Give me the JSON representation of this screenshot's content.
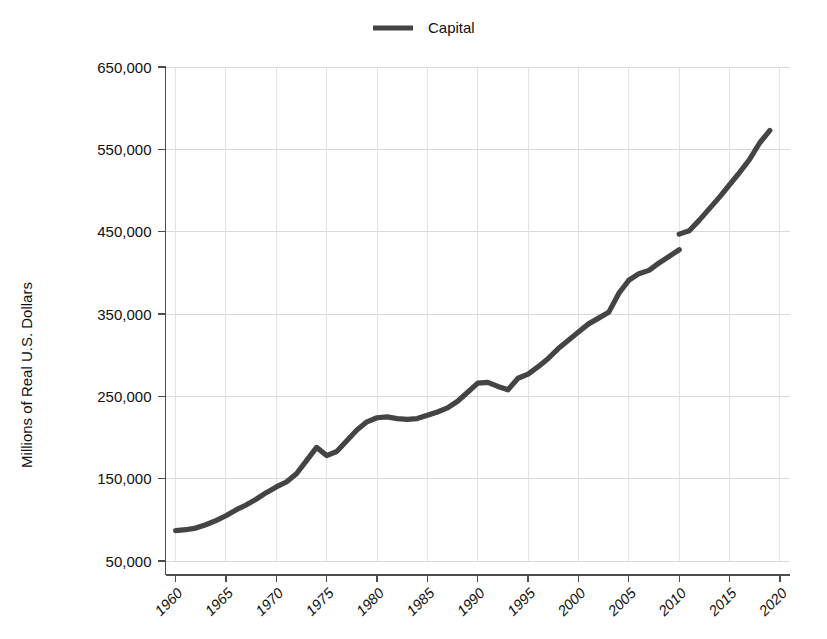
{
  "chart_data": {
    "type": "line",
    "title": "",
    "xlabel": "",
    "ylabel": "Millions of Real U.S. Dollars",
    "legend": {
      "position": "top-center",
      "entries": [
        "Capital"
      ]
    },
    "series_color": "#444444",
    "grid": true,
    "xlim": [
      1959,
      2021
    ],
    "ylim": [
      50000,
      650000
    ],
    "y_ticks": [
      50000,
      150000,
      250000,
      350000,
      450000,
      550000,
      650000
    ],
    "y_tick_labels": [
      "50,000",
      "150,000",
      "250,000",
      "350,000",
      "450,000",
      "550,000",
      "650,000"
    ],
    "x_ticks": [
      1960,
      1965,
      1970,
      1975,
      1980,
      1985,
      1990,
      1995,
      2000,
      2005,
      2010,
      2015,
      2020
    ],
    "x_tick_labels": [
      "1960",
      "1965",
      "1970",
      "1975",
      "1980",
      "1985",
      "1990",
      "1995",
      "2000",
      "2005",
      "2010",
      "2015",
      "2020"
    ],
    "series": [
      {
        "name": "Capital",
        "color": "#444444",
        "x": [
          1960,
          1961,
          1962,
          1963,
          1964,
          1965,
          1966,
          1967,
          1968,
          1969,
          1970,
          1971,
          1972,
          1973,
          1974,
          1975,
          1976,
          1977,
          1978,
          1979,
          1980,
          1981,
          1982,
          1983,
          1984,
          1985,
          1986,
          1987,
          1988,
          1989,
          1990,
          1991,
          1992,
          1993,
          1994,
          1995,
          1996,
          1997,
          1998,
          1999,
          2000,
          2001,
          2002,
          2003,
          2004,
          2005,
          2006,
          2007,
          2008,
          2009,
          2010,
          2011,
          2012,
          2013,
          2014,
          2015,
          2016,
          2017,
          2018,
          2019
        ],
        "values": [
          87000,
          88000,
          90000,
          94000,
          99000,
          105000,
          112000,
          118000,
          125000,
          133000,
          140000,
          146000,
          156000,
          172000,
          188000,
          178000,
          183000,
          196000,
          209000,
          219000,
          224000,
          225000,
          223000,
          222000,
          223000,
          227000,
          231000,
          236000,
          244000,
          255000,
          266000,
          267000,
          262000,
          258000,
          272000,
          277000,
          286000,
          296000,
          308000,
          318000,
          328000,
          338000,
          345000,
          352000,
          375000,
          391000,
          399000,
          403000,
          412000,
          420000,
          428000,
          451000,
          464000,
          478000,
          492000,
          507000,
          522000,
          538000,
          558000,
          573000
        ]
      }
    ],
    "series_breaks": [
      {
        "after_x": 2010,
        "resume_value": 447000,
        "note": "visible vertical discontinuity at 2010"
      }
    ]
  },
  "legend_item": {
    "label": "Capital"
  },
  "axes": {
    "y_title": "Millions of Real U.S. Dollars"
  }
}
